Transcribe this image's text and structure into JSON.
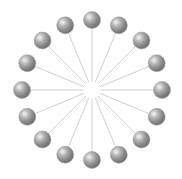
{
  "figure": {
    "type": "radial-star-graph",
    "background_color": "#ffffff",
    "width": 182,
    "height": 179
  },
  "graph": {
    "layout": "radial-star",
    "node_count": 16,
    "edge_count": 16,
    "center": {
      "x": 92,
      "y": 90
    },
    "radius": 70,
    "hub_visible": false,
    "hub_gap_radius": 9,
    "angle_step_degrees": 22.5,
    "start_angle_degrees": -90,
    "node": {
      "shape": "sphere",
      "radius": 8.5,
      "fill_color": "#8a8a8a",
      "highlight_color": "#e8e8e8",
      "shade_color": "#6a6a6a",
      "outline_color": "#9a9a9a",
      "highlight_offset_x": -0.32,
      "highlight_offset_y": -0.34
    },
    "edge": {
      "color": "#d0d0d0",
      "width": 1
    },
    "nodes": [
      {
        "id": "n1",
        "label": "1",
        "angle_degrees": -90.0,
        "x": 92.0,
        "y": 20.0
      },
      {
        "id": "n2",
        "label": "2",
        "angle_degrees": -67.5,
        "x": 118.8,
        "y": 25.3
      },
      {
        "id": "n3",
        "label": "3",
        "angle_degrees": -45.0,
        "x": 141.5,
        "y": 40.5
      },
      {
        "id": "n4",
        "label": "4",
        "angle_degrees": -22.5,
        "x": 156.7,
        "y": 63.2
      },
      {
        "id": "n5",
        "label": "5",
        "angle_degrees": 0.0,
        "x": 162.0,
        "y": 90.0
      },
      {
        "id": "n6",
        "label": "6",
        "angle_degrees": 22.5,
        "x": 156.7,
        "y": 116.8
      },
      {
        "id": "n7",
        "label": "7",
        "angle_degrees": 45.0,
        "x": 141.5,
        "y": 139.5
      },
      {
        "id": "n8",
        "label": "8",
        "angle_degrees": 67.5,
        "x": 118.8,
        "y": 154.7
      },
      {
        "id": "n9",
        "label": "9",
        "angle_degrees": 90.0,
        "x": 92.0,
        "y": 160.0
      },
      {
        "id": "n10",
        "label": "10",
        "angle_degrees": 112.5,
        "x": 65.2,
        "y": 154.7
      },
      {
        "id": "n11",
        "label": "11",
        "angle_degrees": 135.0,
        "x": 42.5,
        "y": 139.5
      },
      {
        "id": "n12",
        "label": "12",
        "angle_degrees": 157.5,
        "x": 27.3,
        "y": 116.8
      },
      {
        "id": "n13",
        "label": "13",
        "angle_degrees": 180.0,
        "x": 22.0,
        "y": 90.0
      },
      {
        "id": "n14",
        "label": "14",
        "angle_degrees": 202.5,
        "x": 27.3,
        "y": 63.2
      },
      {
        "id": "n15",
        "label": "15",
        "angle_degrees": 225.0,
        "x": 42.5,
        "y": 40.5
      },
      {
        "id": "n16",
        "label": "16",
        "angle_degrees": 247.5,
        "x": 65.2,
        "y": 25.3
      }
    ],
    "edges": [
      {
        "id": "e1",
        "from": "hub",
        "to": "n1"
      },
      {
        "id": "e2",
        "from": "hub",
        "to": "n2"
      },
      {
        "id": "e3",
        "from": "hub",
        "to": "n3"
      },
      {
        "id": "e4",
        "from": "hub",
        "to": "n4"
      },
      {
        "id": "e5",
        "from": "hub",
        "to": "n5"
      },
      {
        "id": "e6",
        "from": "hub",
        "to": "n6"
      },
      {
        "id": "e7",
        "from": "hub",
        "to": "n7"
      },
      {
        "id": "e8",
        "from": "hub",
        "to": "n8"
      },
      {
        "id": "e9",
        "from": "hub",
        "to": "n9"
      },
      {
        "id": "e10",
        "from": "hub",
        "to": "n10"
      },
      {
        "id": "e11",
        "from": "hub",
        "to": "n11"
      },
      {
        "id": "e12",
        "from": "hub",
        "to": "n12"
      },
      {
        "id": "e13",
        "from": "hub",
        "to": "n13"
      },
      {
        "id": "e14",
        "from": "hub",
        "to": "n14"
      },
      {
        "id": "e15",
        "from": "hub",
        "to": "n15"
      },
      {
        "id": "e16",
        "from": "hub",
        "to": "n16"
      }
    ]
  }
}
